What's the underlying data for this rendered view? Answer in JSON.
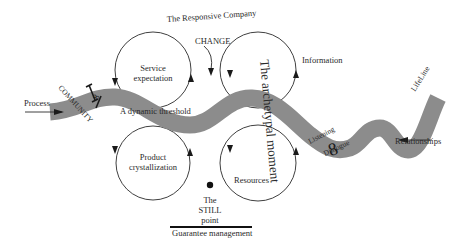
{
  "title": "The Responsive Company",
  "labels": {
    "change": "CHANGE",
    "process": "Process",
    "community": "COMMUNITY",
    "dynamic_threshold": "A dynamic threshold",
    "archetypal_moment": "The archetypal moment",
    "information": "Information",
    "lifeline": "LifeLine",
    "listening": "Listening",
    "dialogue": "Dialogue",
    "relationships": "Relationships",
    "resources": "Resources",
    "still_point_line1": "The",
    "still_point_line2": "STILL",
    "still_point_line3": "point",
    "guarantee": "Guarantee management",
    "eight_symbol": "8",
    "infinity_symbol": "∞"
  },
  "cycles": [
    {
      "id": "service",
      "line1": "Service",
      "line2": "expectation"
    },
    {
      "id": "product",
      "line1": "Product",
      "line2": "crystallization"
    },
    {
      "id": "information-cycle",
      "line1": "",
      "line2": ""
    },
    {
      "id": "resources-cycle",
      "line1": "",
      "line2": ""
    }
  ],
  "colors": {
    "band": "#8c8c8c",
    "stroke": "#2a2a2a",
    "background": "#ffffff"
  }
}
